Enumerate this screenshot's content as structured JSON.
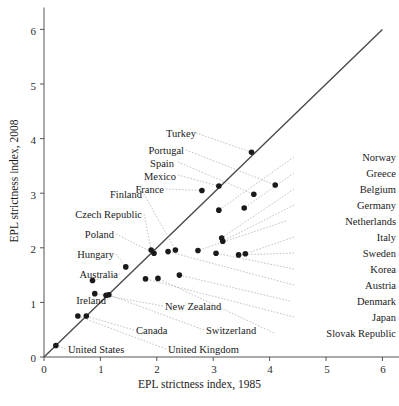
{
  "chart_data": {
    "type": "scatter",
    "title": "",
    "xlabel": "EPL strictness index, 1985",
    "ylabel": "EPL strictness index, 2008",
    "xlim": [
      0,
      6.4
    ],
    "ylim": [
      0,
      6.4
    ],
    "xticks": [
      0,
      1,
      2,
      3,
      4,
      5,
      6
    ],
    "yticks": [
      0,
      1,
      2,
      3,
      4,
      5,
      6
    ],
    "grid": false,
    "legend": "none",
    "reference_line": {
      "name": "45-degree-line",
      "from": [
        0,
        0
      ],
      "to": [
        6,
        6
      ],
      "color": "#4a4a4a"
    },
    "marker_color": "#1a1a1a",
    "points": [
      {
        "name": "United States",
        "x": 0.21,
        "y": 0.21
      },
      {
        "name": "United Kingdom",
        "x": 0.6,
        "y": 0.75
      },
      {
        "name": "Canada",
        "x": 0.75,
        "y": 0.75
      },
      {
        "name": "New Zealand",
        "x": 0.9,
        "y": 1.16
      },
      {
        "name": "Ireland",
        "x": 1.1,
        "y": 1.13
      },
      {
        "name": "Australia",
        "x": 0.86,
        "y": 1.4
      },
      {
        "name": "Hungary",
        "x": 1.45,
        "y": 1.65
      },
      {
        "name": "Poland",
        "x": 1.95,
        "y": 1.9
      },
      {
        "name": "Czech Republic",
        "x": 1.9,
        "y": 1.96
      },
      {
        "name": "Switzerland",
        "x": 1.15,
        "y": 1.14
      },
      {
        "name": "Denmark",
        "x": 2.4,
        "y": 1.5
      },
      {
        "name": "Japan",
        "x": 1.8,
        "y": 1.43
      },
      {
        "name": "Slovak Republic",
        "x": 2.02,
        "y": 1.44
      },
      {
        "name": "Korea",
        "x": 3.05,
        "y": 1.9
      },
      {
        "name": "Austria",
        "x": 2.2,
        "y": 1.93
      },
      {
        "name": "Sweden",
        "x": 3.45,
        "y": 1.87
      },
      {
        "name": "Italy",
        "x": 3.57,
        "y": 1.89
      },
      {
        "name": "Netherlands",
        "x": 2.73,
        "y": 1.95
      },
      {
        "name": "Germany",
        "x": 3.17,
        "y": 2.12
      },
      {
        "name": "Belgium",
        "x": 3.15,
        "y": 2.18
      },
      {
        "name": "Greece",
        "x": 3.55,
        "y": 2.73
      },
      {
        "name": "Norway",
        "x": 3.1,
        "y": 2.69
      },
      {
        "name": "Finland",
        "x": 2.33,
        "y": 1.96
      },
      {
        "name": "France",
        "x": 2.8,
        "y": 3.05
      },
      {
        "name": "Mexico",
        "x": 3.1,
        "y": 3.13
      },
      {
        "name": "Spain",
        "x": 3.72,
        "y": 2.98
      },
      {
        "name": "Portugal",
        "x": 4.1,
        "y": 3.15
      },
      {
        "name": "Turkey",
        "x": 3.68,
        "y": 3.75
      }
    ],
    "annotations": {
      "left_column": [
        "Finland",
        "Czech Republic",
        "Poland",
        "Hungary",
        "Australia",
        "Ireland"
      ],
      "upper_left_column": [
        "Turkey",
        "Portugal",
        "Spain",
        "Mexico",
        "France"
      ],
      "right_column": [
        "Norway",
        "Greece",
        "Belgium",
        "Germany",
        "Netherlands",
        "Italy",
        "Sweden",
        "Korea",
        "Austria",
        "Denmark",
        "Japan",
        "Slovak Republic"
      ],
      "bottom_labels": [
        "New Zealand",
        "Switzerland",
        "Canada",
        "United Kingdom",
        "United States"
      ]
    }
  },
  "axes": {
    "x_title": "EPL strictness index, 1985",
    "y_title": "EPL strictness index, 2008",
    "x_tick_labels": [
      "0",
      "1",
      "2",
      "3",
      "4",
      "5",
      "6"
    ],
    "y_tick_labels": [
      "0",
      "1",
      "2",
      "3",
      "4",
      "5",
      "6"
    ]
  },
  "labels": {
    "turkey": "Turkey",
    "portugal": "Portugal",
    "spain": "Spain",
    "mexico": "Mexico",
    "france": "France",
    "finland": "Finland",
    "czech_republic": "Czech Republic",
    "poland": "Poland",
    "hungary": "Hungary",
    "australia": "Australia",
    "ireland": "Ireland",
    "united_states": "United States",
    "united_kingdom": "United Kingdom",
    "canada": "Canada",
    "new_zealand": "New Zealand",
    "switzerland": "Switzerland",
    "norway": "Norway",
    "greece": "Greece",
    "belgium": "Belgium",
    "germany": "Germany",
    "netherlands": "Netherlands",
    "italy": "Italy",
    "sweden": "Sweden",
    "korea": "Korea",
    "austria": "Austria",
    "denmark": "Denmark",
    "japan": "Japan",
    "slovak_republic": "Slovak Republic"
  }
}
